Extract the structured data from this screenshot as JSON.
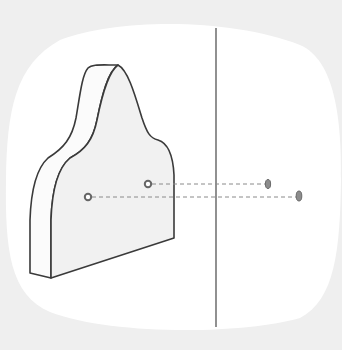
{
  "diagram": {
    "description": "Thick flat 3D plate with peaked top, two marked points on its face projected by dashed lines through a vertical plane line to two points on the right",
    "colors": {
      "background": "#efefef",
      "blob": "#ffffff",
      "face_fill": "#f1f1f1",
      "edge_fill": "#fbfbfb",
      "stroke": "#3a3a3a",
      "dash": "#8a8a8a",
      "point": "#777777"
    },
    "plane_line": {
      "x": 216,
      "y1": 28,
      "y2": 327
    },
    "points_left": [
      {
        "name": "left-point-lower",
        "x": 88,
        "y": 197
      },
      {
        "name": "left-point-upper",
        "x": 148,
        "y": 184
      }
    ],
    "points_right": [
      {
        "name": "right-point-upper",
        "x": 268,
        "y": 184
      },
      {
        "name": "right-point-lower",
        "x": 299,
        "y": 196
      }
    ],
    "projection_lines": [
      {
        "x1": 92,
        "y1": 197,
        "x2": 296,
        "y2": 197
      },
      {
        "x1": 152,
        "y1": 184,
        "x2": 265,
        "y2": 184
      }
    ]
  }
}
